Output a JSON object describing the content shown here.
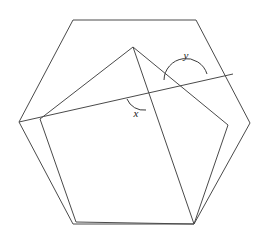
{
  "figure": {
    "stroke_color": "#4a4a4a",
    "background_color": "#ffffff",
    "canvas": {
      "width": 268,
      "height": 243
    }
  },
  "labels": {
    "angle_x": "x",
    "angle_y": "y"
  },
  "label_positions": {
    "angle_x": {
      "x": 136,
      "y": 114
    },
    "angle_y": {
      "x": 186,
      "y": 56
    }
  },
  "shapes": {
    "hexagon": {
      "name": "outer-hexagon",
      "points": "73,20 196,20 250,123 194,224 73,224 19,122"
    },
    "pentagon": {
      "name": "inner-pentagon",
      "points": "40,119 133,47 228,125 194,224 76,222"
    },
    "transversal": {
      "name": "transversal-line",
      "x1": 19,
      "y1": 122,
      "x2": 233,
      "y2": 74
    },
    "apex_to_bottom_right": {
      "name": "apex-to-bottom-right-segment",
      "x1": 133,
      "y1": 47,
      "x2": 194,
      "y2": 224
    }
  },
  "arcs": {
    "angle_x_arc": {
      "name": "angle-x-arc",
      "path": "M 127 99 A 18 18 0 0 0 146 110"
    },
    "angle_y_arc": {
      "name": "angle-y-arc",
      "path": "M 164 80 A 22 22 0 0 1 207 74"
    }
  }
}
